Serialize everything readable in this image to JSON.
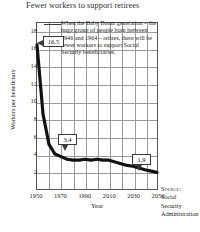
{
  "chart_data": {
    "type": "line",
    "title": "Fewer workers to support retirees",
    "xlabel": "Year",
    "ylabel": "Workers per beneficiary",
    "xlim": [
      1950,
      2050
    ],
    "ylim": [
      0,
      19
    ],
    "grid": true,
    "legend": null,
    "x": [
      1950,
      1955,
      1960,
      1965,
      1970,
      1975,
      1980,
      1985,
      1990,
      1995,
      2000,
      2005,
      2010,
      2015,
      2020,
      2025,
      2030,
      2035,
      2040,
      2045,
      2050
    ],
    "values": [
      16.5,
      8.6,
      5.1,
      4.0,
      3.7,
      3.4,
      3.3,
      3.3,
      3.4,
      3.3,
      3.4,
      3.3,
      3.3,
      3.1,
      2.9,
      2.7,
      2.6,
      2.4,
      2.2,
      2.05,
      1.9
    ],
    "ytick_labels": [
      "18",
      "16",
      "14",
      "12",
      "10",
      "8",
      "6",
      "4",
      "2"
    ],
    "ytick_values": [
      18,
      16,
      14,
      12,
      10,
      8,
      6,
      4,
      2
    ],
    "xtick_labels": [
      "1950",
      "1970",
      "1990",
      "2010",
      "2030",
      "2050"
    ],
    "xtick_values": [
      1950,
      1970,
      1990,
      2010,
      2030,
      2050
    ],
    "xminor_values": [
      1960,
      1980,
      2000,
      2020,
      2040
    ],
    "annotations": [
      {
        "name": "callout-1950",
        "label": "16.5",
        "x": 1950,
        "y": 16.5
      },
      {
        "name": "callout-1970",
        "label": "3.4",
        "x": 1975,
        "y": 3.4
      },
      {
        "name": "callout-2050",
        "label": "1.9",
        "x": 2050,
        "y": 1.9
      }
    ],
    "note": "When the Baby Boom generation – the huge group of people born between 1946 and 1964 – retires, there will be fewer workers to support Social Security beneficiaries.",
    "source_label": "Source:",
    "source_lines": [
      "Social",
      "Security",
      "Administration"
    ]
  },
  "colors": {
    "series": "#111111",
    "grid": "#9a9a9a",
    "frame": "#555555",
    "text": "#222222",
    "background": "#ffffff"
  }
}
